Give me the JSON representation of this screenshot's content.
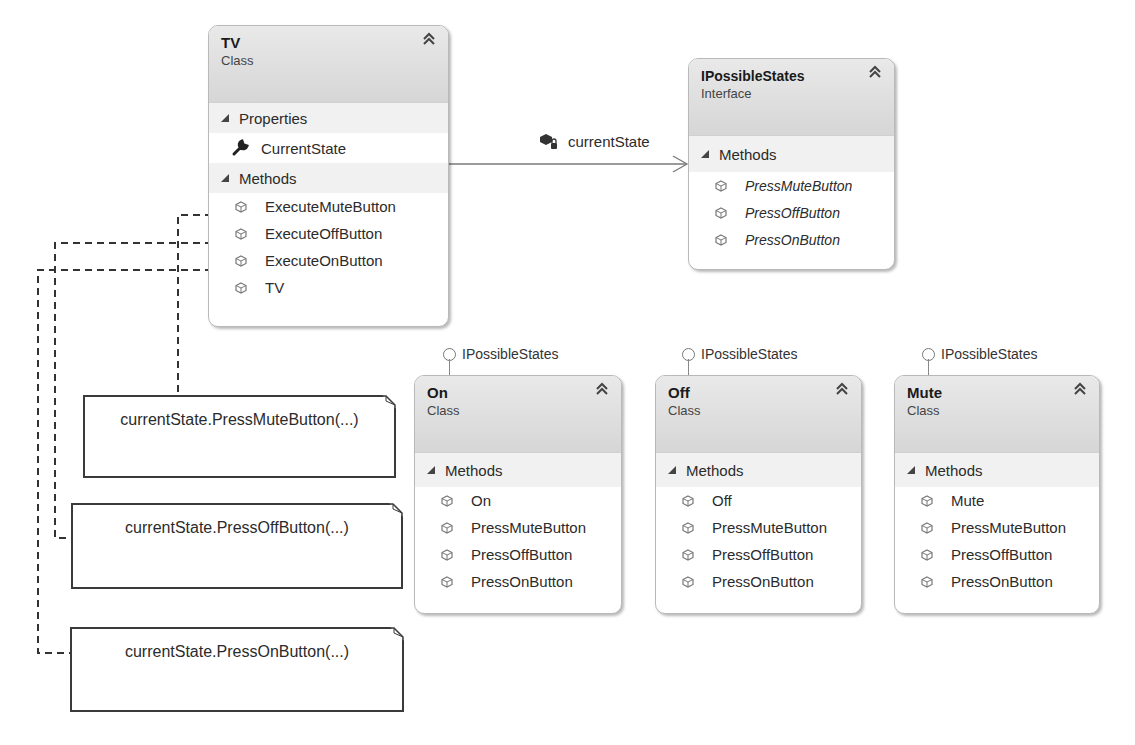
{
  "diagram": {
    "type": "class-diagram",
    "classes": {
      "tv": {
        "name": "TV",
        "kind": "Class",
        "properties_label": "Properties",
        "properties": [
          "CurrentState"
        ],
        "methods_label": "Methods",
        "methods": [
          "ExecuteMuteButton",
          "ExecuteOffButton",
          "ExecuteOnButton",
          "TV"
        ]
      },
      "ipossiblestates": {
        "name": "IPossibleStates",
        "kind": "Interface",
        "methods_label": "Methods",
        "methods": [
          "PressMuteButton",
          "PressOffButton",
          "PressOnButton"
        ]
      },
      "on": {
        "name": "On",
        "kind": "Class",
        "implements": "IPossibleStates",
        "methods_label": "Methods",
        "methods": [
          "On",
          "PressMuteButton",
          "PressOffButton",
          "PressOnButton"
        ]
      },
      "off": {
        "name": "Off",
        "kind": "Class",
        "implements": "IPossibleStates",
        "methods_label": "Methods",
        "methods": [
          "Off",
          "PressMuteButton",
          "PressOffButton",
          "PressOnButton"
        ]
      },
      "mute": {
        "name": "Mute",
        "kind": "Class",
        "implements": "IPossibleStates",
        "methods_label": "Methods",
        "methods": [
          "Mute",
          "PressMuteButton",
          "PressOffButton",
          "PressOnButton"
        ]
      }
    },
    "association": {
      "label": "currentState",
      "from": "TV",
      "to": "IPossibleStates"
    },
    "notes": [
      {
        "text": "currentState.PressMuteButton(...)",
        "attached_to": "ExecuteMuteButton"
      },
      {
        "text": "currentState.PressOffButton(...)",
        "attached_to": "ExecuteOffButton"
      },
      {
        "text": "currentState.PressOnButton(...)",
        "attached_to": "ExecuteOnButton"
      }
    ],
    "icons": {
      "collapse": "double-chevron-up-icon",
      "section_toggle": "triangle-expanded-icon",
      "property": "wrench-icon",
      "method": "method-cube-icon",
      "field": "private-field-icon",
      "interface_lollipop": "lollipop-icon"
    },
    "colors": {
      "header_bg": "#dcdcdc",
      "section_bg": "#f1f1f1",
      "border": "#b9b9b9",
      "connector": "#3a3a3a"
    }
  }
}
